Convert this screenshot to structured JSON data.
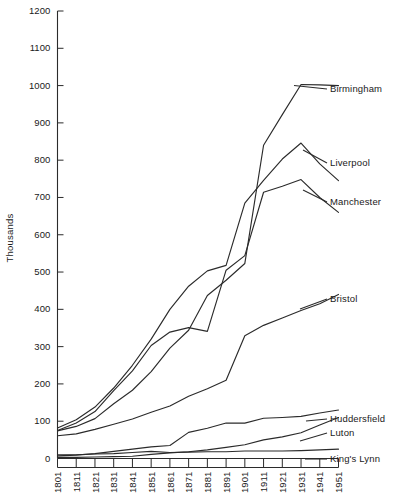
{
  "chart_data": {
    "type": "line",
    "title": "",
    "subtitle": "",
    "xlabel": "",
    "ylabel": "Thousands",
    "xlim": [
      1801,
      1951
    ],
    "ylim": [
      0,
      1200
    ],
    "grid": false,
    "legend_position": "right-inline-labels",
    "x": [
      1801,
      1811,
      1821,
      1831,
      1841,
      1851,
      1861,
      1871,
      1881,
      1891,
      1901,
      1911,
      1921,
      1931,
      1941,
      1951
    ],
    "xtick_labels": [
      "1801",
      "1811",
      "1821",
      "1831",
      "1841",
      "1851",
      "1861",
      "1871",
      "1881",
      "1891",
      "1901",
      "1911",
      "1921",
      "1931",
      "1941",
      "1951"
    ],
    "ytick_labels": [
      "0",
      "100",
      "200",
      "300",
      "400",
      "500",
      "600",
      "700",
      "800",
      "900",
      "1000",
      "1100",
      "1200"
    ],
    "ytick_values": [
      0,
      100,
      200,
      300,
      400,
      500,
      600,
      700,
      800,
      900,
      1000,
      1100,
      1200
    ],
    "series": [
      {
        "name": "Birmingham",
        "label": "Birmingham",
        "values": [
          74,
          86,
          107,
          147,
          183,
          233,
          296,
          344,
          437,
          478,
          523,
          840,
          922,
          1003,
          1002,
          1000
        ],
        "label_x": 1951,
        "label_y": 1000
      },
      {
        "name": "Liverpool",
        "label": "Liverpool",
        "values": [
          82,
          104,
          138,
          189,
          250,
          320,
          400,
          462,
          503,
          518,
          685,
          746,
          803,
          846,
          790,
          745
        ],
        "label_x": 1951,
        "label_y": 790
      },
      {
        "name": "Manchester",
        "label": "Manchester",
        "values": [
          75,
          95,
          126,
          182,
          235,
          303,
          339,
          351,
          341,
          505,
          544,
          714,
          730,
          748,
          700,
          660
        ],
        "label_x": 1951,
        "label_y": 660
      },
      {
        "name": "Bristol",
        "label": "Bristol",
        "values": [
          61,
          66,
          78,
          92,
          106,
          124,
          141,
          167,
          187,
          210,
          329,
          357,
          377,
          397,
          415,
          440
        ],
        "label_x": 1951,
        "label_y": 440
      },
      {
        "name": "Huddersfield",
        "label": "Huddersfield",
        "values": [
          7,
          9,
          13,
          19,
          25,
          31,
          35,
          70,
          81,
          95,
          95,
          108,
          110,
          113,
          122,
          130
        ],
        "label_x": 1951,
        "label_y": 130
      },
      {
        "name": "Luton",
        "label": "Luton",
        "values": [
          3,
          3,
          4,
          5,
          6,
          11,
          15,
          18,
          23,
          30,
          37,
          50,
          58,
          69,
          90,
          110
        ],
        "label_x": 1951,
        "label_y": 110
      },
      {
        "name": "King's Lynn",
        "label": "King's Lynn",
        "values": [
          10,
          10,
          12,
          13,
          16,
          19,
          16,
          17,
          18,
          18,
          20,
          20,
          20,
          21,
          23,
          25
        ],
        "label_x": 1951,
        "label_y": 25
      }
    ],
    "colors": {
      "line": "#2b2b2b",
      "axis": "#2b2b2b",
      "text": "#1a1a1a",
      "background": "#ffffff"
    }
  }
}
